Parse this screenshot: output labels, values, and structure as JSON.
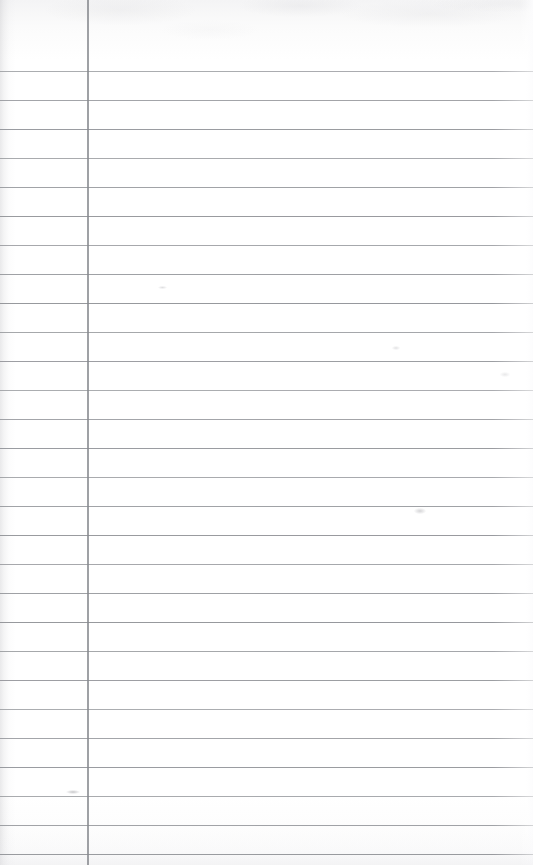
{
  "document": {
    "kind": "scanned-lined-paper",
    "title": "",
    "page_width": 533,
    "page_height": 865,
    "background_color": "#ffffff",
    "orientation": "portrait",
    "is_blank": true,
    "visible_text": []
  },
  "paper": {
    "type": "ruled-notepad-page",
    "paper_color": "#ffffff",
    "rule_color": "#8e9095",
    "margin_rule_color": "#87898f",
    "header_area_label": "",
    "header_area_height": 71
  },
  "ruling": {
    "line_count": 28,
    "first_line_y": 71,
    "line_spacing": 29.0,
    "line_thickness": 1,
    "line_left_x": 0,
    "line_right_x": 533,
    "line_y_positions": [
      71,
      100,
      129,
      158,
      187,
      216,
      245,
      274,
      303,
      332,
      361,
      390,
      419,
      448,
      477,
      506,
      535,
      564,
      593,
      622,
      651,
      680,
      709,
      738,
      767,
      796,
      825,
      854
    ]
  },
  "margin_rule": {
    "x": 87,
    "thickness": 2,
    "top_y": 0,
    "bottom_y": 865,
    "label": "left-margin-rule"
  },
  "scan_artifacts": {
    "left_edge_shadow": true,
    "right_edge_highlight": true,
    "top_mottling": true,
    "bottom_tint": true,
    "smudges": [
      {
        "name": "pencil-smudge-left-lower",
        "x": 66,
        "y": 790
      },
      {
        "name": "pencil-speck-right-mid",
        "x": 414,
        "y": 508
      },
      {
        "name": "pencil-speck-left-upper",
        "x": 158,
        "y": 286
      },
      {
        "name": "pencil-speck-right-upper",
        "x": 392,
        "y": 346
      },
      {
        "name": "pencil-speck-far-right",
        "x": 500,
        "y": 372
      }
    ]
  },
  "content": {
    "header_entries": [],
    "line_entries": []
  }
}
